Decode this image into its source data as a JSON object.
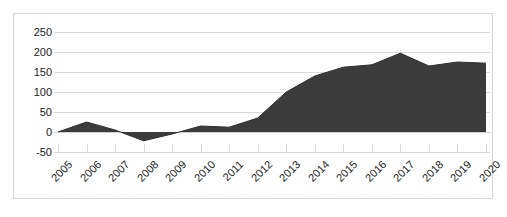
{
  "chart_data": {
    "type": "area",
    "title": "",
    "subtitle": "",
    "xlabel": "",
    "ylabel": "",
    "categories": [
      "2005",
      "2006",
      "2007",
      "2008",
      "2009",
      "2010",
      "2011",
      "2012",
      "2013",
      "2014",
      "2015",
      "2016",
      "2017",
      "2018",
      "2019",
      "2020"
    ],
    "values": [
      0,
      25,
      5,
      -22,
      -5,
      15,
      12,
      35,
      100,
      140,
      162,
      168,
      197,
      165,
      175,
      172
    ],
    "series": [
      {
        "name": "",
        "values": [
          0,
          25,
          5,
          -22,
          -5,
          15,
          12,
          35,
          100,
          140,
          162,
          168,
          197,
          165,
          175,
          172
        ]
      }
    ],
    "ylim": [
      -50,
      250
    ],
    "yticks": [
      250,
      200,
      150,
      100,
      50,
      0,
      -50
    ],
    "ytick_labels": [
      "250",
      "200",
      "150",
      "100",
      "50",
      "0",
      "-50"
    ],
    "xtick_labels": [
      "2005",
      "2006",
      "2007",
      "2008",
      "2009",
      "2010",
      "2011",
      "2012",
      "2013",
      "2014",
      "2015",
      "2016",
      "2017",
      "2018",
      "2019",
      "2020"
    ],
    "grid": true,
    "legend": false,
    "legend_position": "none",
    "colors": {
      "area_fill": "#3b3b3b",
      "area_line": "#2e2e2e",
      "gridline": "#d9d9d9",
      "border": "#d5d5d5",
      "text": "#1a1a1a",
      "background": "#ffffff"
    }
  }
}
